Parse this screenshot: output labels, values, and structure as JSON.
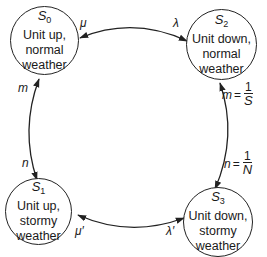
{
  "diagram": {
    "type": "state-transition",
    "states": [
      {
        "id": "S",
        "sub": "0",
        "line1": "Unit up,",
        "line2": "normal",
        "line3": "weather"
      },
      {
        "id": "S",
        "sub": "1",
        "line1": "Unit up,",
        "line2": "stormy",
        "line3": "weather"
      },
      {
        "id": "S",
        "sub": "2",
        "line1": "Unit down,",
        "line2": "normal",
        "line3": "weather"
      },
      {
        "id": "S",
        "sub": "3",
        "line1": "Unit down,",
        "line2": "stormy",
        "line3": "weather"
      }
    ],
    "transitions": [
      {
        "from": "S0",
        "to": "S2",
        "label": "λ"
      },
      {
        "from": "S2",
        "to": "S0",
        "label": "μ"
      },
      {
        "from": "S1",
        "to": "S0",
        "label": "m"
      },
      {
        "from": "S0",
        "to": "S1",
        "label": "n"
      },
      {
        "from": "S3",
        "to": "S2",
        "label": "m",
        "eq": "=",
        "num": "1",
        "den": "S"
      },
      {
        "from": "S2",
        "to": "S3",
        "label": "n",
        "eq": "=",
        "num": "1",
        "den": "N"
      },
      {
        "from": "S1",
        "to": "S3",
        "label": "λ′"
      },
      {
        "from": "S3",
        "to": "S1",
        "label": "μ′"
      }
    ]
  }
}
